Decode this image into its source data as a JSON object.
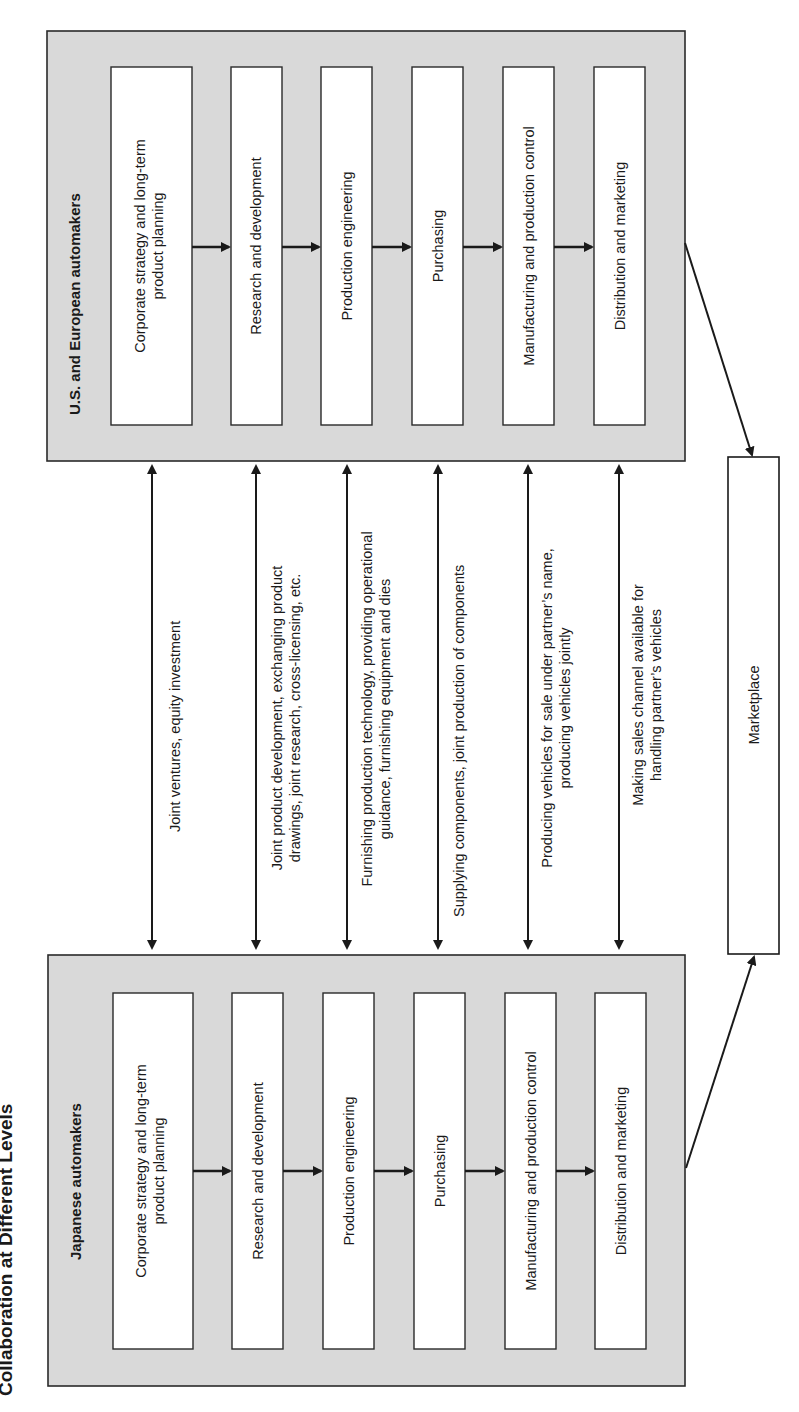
{
  "title": "Collaboration at Different Levels",
  "groups": {
    "us_european": {
      "title": "U.S. and European automakers",
      "steps": [
        {
          "line1": "Corporate strategy and long-term",
          "line2": "product planning"
        },
        {
          "line1": "Research and development",
          "line2": ""
        },
        {
          "line1": "Production engineering",
          "line2": ""
        },
        {
          "line1": "Purchasing",
          "line2": ""
        },
        {
          "line1": "Manufacturing and production control",
          "line2": ""
        },
        {
          "line1": "Distribution and marketing",
          "line2": ""
        }
      ]
    },
    "japanese": {
      "title": "Japanese automakers",
      "steps": [
        {
          "line1": "Corporate strategy and long-term",
          "line2": "product planning"
        },
        {
          "line1": "Research and development",
          "line2": ""
        },
        {
          "line1": "Production engineering",
          "line2": ""
        },
        {
          "line1": "Purchasing",
          "line2": ""
        },
        {
          "line1": "Manufacturing and production control",
          "line2": ""
        },
        {
          "line1": "Distribution and marketing",
          "line2": ""
        }
      ]
    }
  },
  "collaborations": [
    {
      "line1": "Joint ventures, equity investment",
      "line2": ""
    },
    {
      "line1": "Joint product development, exchanging product",
      "line2": "drawings, joint research, cross-licensing, etc."
    },
    {
      "line1": "Furnishing production technology, providing operational",
      "line2": "guidance, furnishing equipment and dies"
    },
    {
      "line1": "Supplying components, joint production of components",
      "line2": ""
    },
    {
      "line1": "Producing vehicles for sale under partner’s name,",
      "line2": "producing vehicles jointly"
    },
    {
      "line1": "Making sales channel available for",
      "line2": "handling partner’s vehicles"
    }
  ],
  "marketplace": {
    "label": "Marketplace"
  },
  "colors": {
    "group_fill": "#d9d9d9",
    "box_fill": "#ffffff",
    "stroke": "#1a1a1a"
  }
}
